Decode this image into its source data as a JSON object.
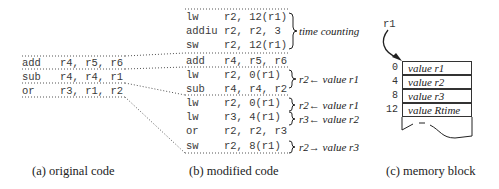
{
  "panel_a": {
    "caption": "(a) original code",
    "lines": [
      {
        "op": "add",
        "args": "r4, r5, r6"
      },
      {
        "op": "sub",
        "args": "r4, r4, r1"
      },
      {
        "op": "or",
        "args": "r3, r1, r2"
      }
    ]
  },
  "panel_b": {
    "caption": "(b) modified code",
    "lines": [
      {
        "op": "lw",
        "args": "r2, 12(r1)"
      },
      {
        "op": "addiu",
        "args": "r2, r2, 3"
      },
      {
        "op": "sw",
        "args": "r2, 12(r1)"
      },
      {
        "op": "add",
        "args": "r4, r5, r6"
      },
      {
        "op": "lw",
        "args": "r2, 0(r1)"
      },
      {
        "op": "sub",
        "args": "r4, r4, r2"
      },
      {
        "op": "lw",
        "args": "r2, 0(r1)"
      },
      {
        "op": "lw",
        "args": "r3, 4(r1)"
      },
      {
        "op": "or",
        "args": "r2, r2, r3"
      },
      {
        "op": "sw",
        "args": "r2, 8(r1)"
      }
    ],
    "annotations": [
      {
        "text": "time counting"
      },
      {
        "text": "r2← value r1"
      },
      {
        "text": "r2← value r1"
      },
      {
        "text": "r3← value r2"
      },
      {
        "text": "r2→ value r3"
      }
    ]
  },
  "panel_c": {
    "caption": "(c) memory block",
    "pointer_label": "r1",
    "cells": [
      {
        "offset": "0",
        "value": "value r1"
      },
      {
        "offset": "4",
        "value": "value r2"
      },
      {
        "offset": "8",
        "value": "value r3"
      },
      {
        "offset": "12",
        "value": "value Rtime"
      }
    ]
  }
}
